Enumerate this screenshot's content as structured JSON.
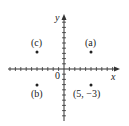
{
  "diagram": {
    "type": "coordinate-plane",
    "axes": {
      "x_label": "x",
      "y_label": "y",
      "origin_label": "0",
      "x_range": [
        -10,
        10
      ],
      "y_range": [
        -10,
        10
      ]
    },
    "points": [
      {
        "id": "a",
        "label": "(a)",
        "x": 5,
        "y": 3
      },
      {
        "id": "b",
        "label": "(b)",
        "x": -5,
        "y": -3
      },
      {
        "id": "c",
        "label": "(c)",
        "x": -5,
        "y": 3
      },
      {
        "id": "given",
        "label": "(5, −3)",
        "x": 5,
        "y": -3
      }
    ],
    "colors": {
      "axis": "#333333",
      "point": "#222222",
      "text": "#222222"
    }
  }
}
